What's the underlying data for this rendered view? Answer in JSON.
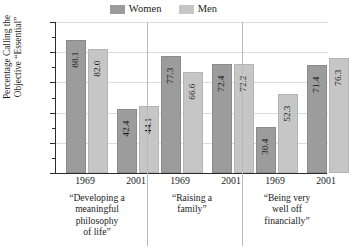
{
  "chart_data": {
    "type": "bar",
    "title": "",
    "xlabel": "",
    "ylabel_lines": [
      "Percentage Calling the",
      "Objective “Essential”"
    ],
    "ylim": [
      0,
      100
    ],
    "ytick_labels": [
      "0",
      "20",
      "40",
      "60",
      "80",
      "100"
    ],
    "ytick_values": [
      0,
      20,
      40,
      60,
      80,
      100
    ],
    "minor_tick_step": 10,
    "grid": true,
    "legend_position": "top-center",
    "categories": [
      "1969",
      "2001",
      "1969",
      "2001",
      "1969",
      "2001"
    ],
    "groups": [
      {
        "caption_lines": [
          "“Developing a",
          "meaningful",
          "philosophy",
          "of life”"
        ],
        "years": [
          "1969",
          "2001"
        ],
        "women": [
          88.1,
          42.4
        ],
        "men": [
          82.0,
          44.1
        ]
      },
      {
        "caption_lines": [
          "“Raising a",
          "family”"
        ],
        "years": [
          "1969",
          "2001"
        ],
        "women": [
          77.3,
          72.4
        ],
        "men": [
          66.6,
          72.2
        ]
      },
      {
        "caption_lines": [
          "“Being very",
          "well off",
          "financially”"
        ],
        "years": [
          "1969",
          "2001"
        ],
        "women": [
          30.4,
          71.4
        ],
        "men": [
          52.3,
          76.3
        ]
      }
    ],
    "series": [
      {
        "name": "Women",
        "values": [
          88.1,
          42.4,
          77.3,
          72.4,
          30.4,
          71.4
        ],
        "color": "#9c9c9c"
      },
      {
        "name": "Men",
        "values": [
          82.0,
          44.1,
          66.6,
          72.2,
          52.3,
          76.3
        ],
        "color": "#c6c6c6"
      }
    ],
    "value_labels": [
      "88.1",
      "82.0",
      "42.4",
      "44.1",
      "77.3",
      "66.6",
      "72.4",
      "72.2",
      "30.4",
      "52.3",
      "71.4",
      "76.3"
    ]
  },
  "legend": {
    "women_label": "Women",
    "men_label": "Men",
    "women_color": "#9c9c9c",
    "men_color": "#c6c6c6"
  }
}
